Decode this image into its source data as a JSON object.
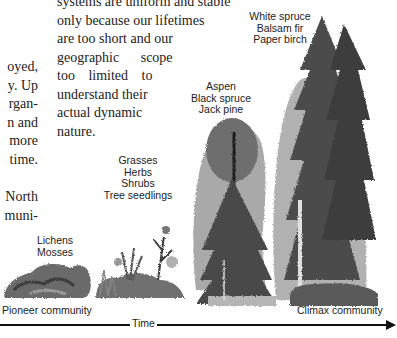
{
  "figure": {
    "stages": [
      {
        "id": "pioneer",
        "species": [
          "Lichens",
          "Mosses"
        ]
      },
      {
        "id": "early",
        "species": [
          "Grasses",
          "Herbs",
          "Shrubs",
          "Tree seedlings"
        ]
      },
      {
        "id": "intermediate",
        "species": [
          "Aspen",
          "Black spruce",
          "Jack pine"
        ]
      },
      {
        "id": "climax",
        "species": [
          "White spruce",
          "Balsam fir",
          "Paper birch"
        ]
      }
    ],
    "axis": {
      "start_label": "Pioneer community",
      "middle_label": "Time",
      "end_label": "Climax community"
    }
  },
  "text": {
    "left_column_fragments": [
      "oyed,",
      "y. Up",
      "rgan-",
      "n and",
      "more",
      "time."
    ],
    "left_column_fragments_2": [
      "North",
      "muni-"
    ],
    "right_column_lines": [
      "systems are uniform and stable",
      "only because our lifetimes",
      "are too short and our",
      "geographic scope",
      "too limited to",
      "understand their",
      "actual dynamic",
      "nature."
    ]
  }
}
